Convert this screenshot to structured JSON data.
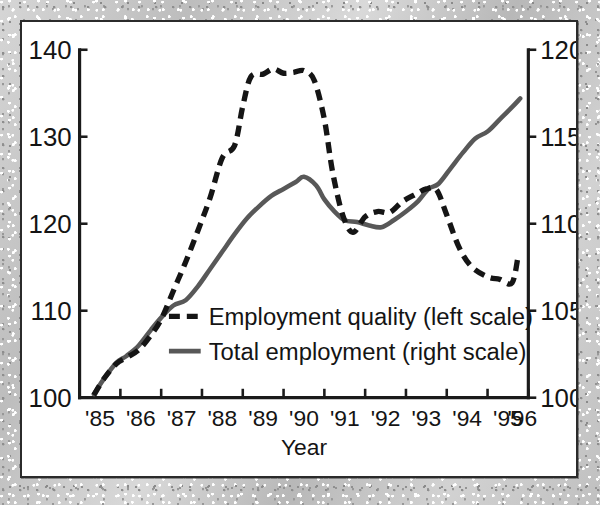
{
  "chart_data": {
    "type": "line",
    "title": "",
    "xlabel": "Year",
    "ylabel_left": "",
    "ylabel_right": "",
    "xlim": [
      1985,
      1996
    ],
    "ylim_left": [
      100,
      140
    ],
    "ylim_right": [
      100,
      120
    ],
    "grid": false,
    "legend_position": "center-left-inside",
    "x_tick_labels": [
      "'85",
      "'86",
      "'87",
      "'88",
      "'89",
      "'90",
      "'91",
      "'92",
      "'93",
      "'94",
      "'95",
      "'96"
    ],
    "x_tick_values": [
      1985,
      1986,
      1987,
      1988,
      1989,
      1990,
      1991,
      1992,
      1993,
      1994,
      1995,
      1996
    ],
    "y_left_tick_labels": [
      "100",
      "110",
      "120",
      "130",
      "140"
    ],
    "y_left_tick_values": [
      100,
      110,
      120,
      130,
      140
    ],
    "y_right_tick_labels": [
      "100",
      "105",
      "110",
      "115",
      "120"
    ],
    "y_right_tick_values": [
      100,
      105,
      110,
      115,
      120
    ],
    "series": [
      {
        "name": "Employment quality (left scale)",
        "axis": "left",
        "style": "dashed",
        "color": "#151515",
        "x": [
          1985.35,
          1985.6,
          1985.9,
          1986.15,
          1986.45,
          1986.75,
          1987.0,
          1987.3,
          1987.6,
          1987.9,
          1988.2,
          1988.5,
          1988.8,
          1989.0,
          1989.2,
          1989.5,
          1989.75,
          1990.0,
          1990.25,
          1990.5,
          1990.75,
          1991.0,
          1991.2,
          1991.45,
          1991.7,
          1992.0,
          1992.3,
          1992.6,
          1992.9,
          1993.2,
          1993.5,
          1993.75,
          1994.0,
          1994.3,
          1994.6,
          1995.0,
          1995.3,
          1995.6,
          1995.75
        ],
        "y": [
          100.3,
          102.2,
          103.9,
          104.6,
          105.5,
          107.2,
          109.0,
          112.3,
          115.6,
          119.2,
          123.0,
          127.6,
          129.0,
          133.5,
          136.9,
          137.2,
          137.8,
          137.3,
          137.4,
          137.6,
          136.5,
          132.0,
          126.0,
          121.0,
          119.0,
          120.8,
          121.4,
          121.3,
          122.5,
          123.3,
          124.0,
          123.9,
          121.0,
          117.3,
          115.1,
          113.9,
          113.6,
          113.2,
          116.3
        ]
      },
      {
        "name": "Total employment (right scale)",
        "axis": "right",
        "style": "solid",
        "color": "#585858",
        "x": [
          1985.35,
          1985.6,
          1985.9,
          1986.15,
          1986.45,
          1986.75,
          1987.0,
          1987.3,
          1987.6,
          1987.9,
          1988.2,
          1988.5,
          1988.8,
          1989.1,
          1989.4,
          1989.7,
          1990.0,
          1990.3,
          1990.5,
          1990.8,
          1991.0,
          1991.25,
          1991.5,
          1991.8,
          1992.1,
          1992.4,
          1992.7,
          1993.0,
          1993.3,
          1993.55,
          1993.8,
          1994.1,
          1994.4,
          1994.7,
          1995.0,
          1995.3,
          1995.6,
          1995.8
        ],
        "y": [
          100.2,
          101.1,
          102.0,
          102.4,
          103.0,
          103.9,
          104.6,
          105.3,
          105.6,
          106.4,
          107.4,
          108.4,
          109.4,
          110.3,
          111.0,
          111.6,
          112.0,
          112.4,
          112.7,
          112.2,
          111.4,
          110.7,
          110.2,
          110.1,
          109.9,
          109.8,
          110.2,
          110.7,
          111.3,
          112.0,
          112.3,
          113.2,
          114.1,
          114.9,
          115.3,
          116.0,
          116.7,
          117.2
        ]
      }
    ]
  },
  "legend": {
    "entries": [
      {
        "label": "Employment quality (left scale)",
        "style": "dashed"
      },
      {
        "label": "Total employment (right scale)",
        "style": "solid"
      }
    ]
  },
  "axes": {
    "x_title": "Year"
  },
  "colors": {
    "dashed_series": "#151515",
    "solid_series": "#585858",
    "axis": "#1b1b1b",
    "panel_background": "#ffffff",
    "panel_border": "#2b2b2b",
    "page_background": "#c6c6c6"
  }
}
